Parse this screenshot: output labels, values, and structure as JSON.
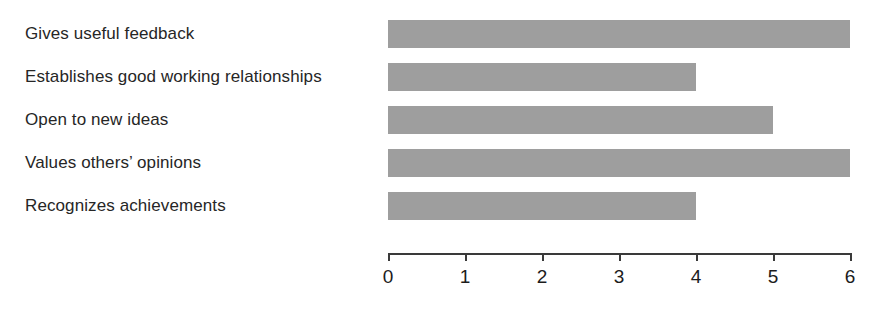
{
  "chart_data": {
    "type": "bar",
    "orientation": "horizontal",
    "title": "",
    "xlabel": "",
    "ylabel": "",
    "categories": [
      "Gives useful feedback",
      "Establishes good working relationships",
      "Open to new ideas",
      "Values others’ opinions",
      "Recognizes achievements"
    ],
    "values": [
      6,
      4,
      5,
      6,
      4
    ],
    "xlim": [
      0,
      6
    ],
    "xticks": [
      0,
      1,
      2,
      3,
      4,
      5,
      6
    ],
    "xtick_labels": [
      "0",
      "1",
      "2",
      "3",
      "4",
      "5",
      "6"
    ],
    "grid": false,
    "legend": false,
    "bar_color": "#9e9e9e",
    "axis_color": "#3a3a3a",
    "background_color": "#ffffff",
    "text_color": "#262626"
  }
}
